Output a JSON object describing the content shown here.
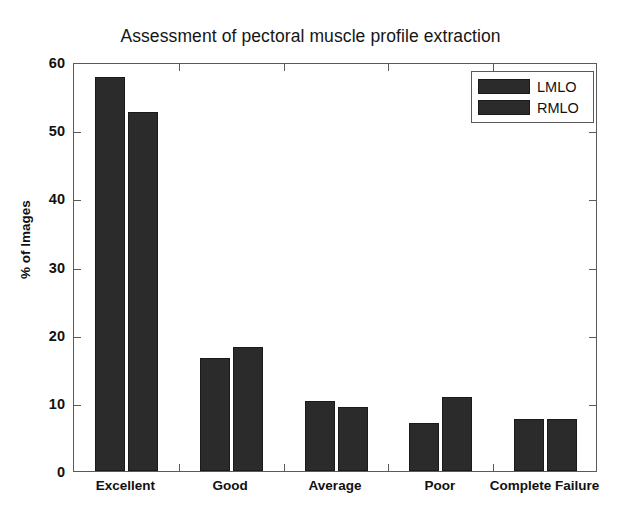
{
  "chart_data": {
    "type": "bar",
    "title": "Assessment of pectoral muscle profile extraction",
    "xlabel": "",
    "ylabel": "% of Images",
    "categories": [
      "Excellent",
      "Good",
      "Average",
      "Poor",
      "Complete Failure"
    ],
    "series": [
      {
        "name": "LMLO",
        "values": [
          57.8,
          16.6,
          10.3,
          7.0,
          7.6
        ],
        "color": "#2b2b2b"
      },
      {
        "name": "RMLO",
        "values": [
          52.7,
          18.2,
          9.4,
          10.9,
          7.6
        ],
        "color": "#2b2b2b"
      }
    ],
    "ylim": [
      0,
      60
    ],
    "yticks": [
      0,
      10,
      20,
      30,
      40,
      50,
      60
    ],
    "ytick_labels": [
      "0",
      "10",
      "20",
      "30",
      "40",
      "50",
      "60"
    ],
    "grid": false,
    "legend_position": "upper right",
    "bar_group_style": "grouped"
  },
  "legend": {
    "entries": [
      {
        "label": "LMLO"
      },
      {
        "label": "RMLO"
      }
    ]
  },
  "colors": {
    "bar_fill": "#2b2b2b",
    "axis": "#5a5a5a",
    "background": "#ffffff",
    "text": "#111111"
  }
}
